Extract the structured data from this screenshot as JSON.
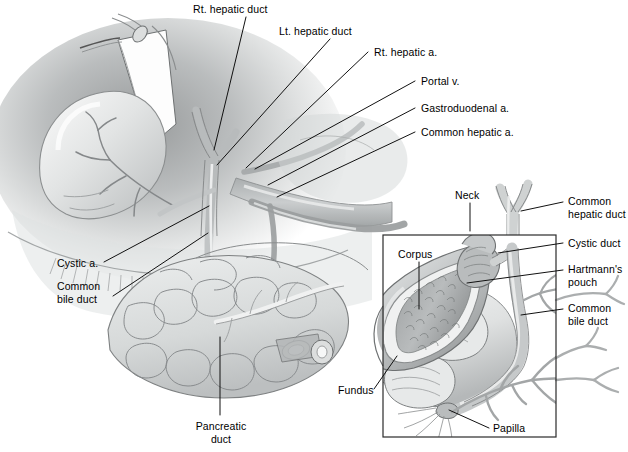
{
  "figure": {
    "style": "grayscale medical line-and-wash illustration",
    "width": 628,
    "height": 452
  },
  "colors": {
    "background": "#ffffff",
    "ink": "#000000",
    "leader_line": "#1a1a1a",
    "inset_border": "#2b2b2b",
    "tissue_light": "#e9eaea",
    "tissue_mid": "#c9cbcb",
    "tissue_dark": "#9a9c9d",
    "tissue_darkest": "#6f7273",
    "duct_fill": "#d7d9d9",
    "outline": "#6e7172"
  },
  "main_view": {
    "name": "operative-view",
    "labels": [
      {
        "id": "rt-hepatic-duct",
        "text": "Rt. hepatic duct",
        "x": 193,
        "y": 3,
        "align": "left",
        "leader": [
          [
            246,
            17
          ],
          [
            214,
            150
          ]
        ]
      },
      {
        "id": "lt-hepatic-duct",
        "text": "Lt. hepatic duct",
        "x": 279,
        "y": 25,
        "align": "left",
        "leader": [
          [
            330,
            39
          ],
          [
            216,
            164
          ]
        ]
      },
      {
        "id": "rt-hepatic-a",
        "text": "Rt. hepatic a.",
        "x": 371,
        "y": 47,
        "align": "left",
        "leader": [
          [
            368,
            52
          ],
          [
            245,
            167
          ]
        ]
      },
      {
        "id": "portal-v",
        "text": "Portal v.",
        "x": 418,
        "y": 76,
        "align": "left",
        "leader": [
          [
            415,
            81
          ],
          [
            254,
            168
          ]
        ]
      },
      {
        "id": "gastroduodenal-a",
        "text": "Gastroduodenal a.",
        "x": 418,
        "y": 103,
        "align": "left",
        "leader": [
          [
            415,
            108
          ],
          [
            268,
            184
          ]
        ]
      },
      {
        "id": "common-hepatic-a",
        "text": "Common hepatic a.",
        "x": 418,
        "y": 127,
        "align": "left",
        "leader": [
          [
            415,
            132
          ],
          [
            276,
            196
          ]
        ]
      },
      {
        "id": "cystic-a",
        "text": "Cystic a.",
        "x": 57,
        "y": 260,
        "align": "left",
        "leader": [
          [
            104,
            262
          ],
          [
            208,
            206
          ]
        ]
      },
      {
        "id": "common-bile-duct-main",
        "text": "Common\nbile duct",
        "x": 57,
        "y": 282,
        "align": "left",
        "leader": [
          [
            112,
            296
          ],
          [
            207,
            232
          ]
        ]
      },
      {
        "id": "pancreatic-duct",
        "text": "Pancreatic\nduct",
        "x": 191,
        "y": 422,
        "align": "center",
        "leader": [
          [
            220,
            415
          ],
          [
            220,
            338
          ]
        ]
      }
    ]
  },
  "inset_view": {
    "name": "detail-inset",
    "box": {
      "x": 383,
      "y": 235,
      "width": 173,
      "height": 202
    },
    "labels": [
      {
        "id": "neck",
        "text": "Neck",
        "x": 455,
        "y": 190,
        "align": "left",
        "leader": [
          [
            470,
            203
          ],
          [
            470,
            230
          ]
        ]
      },
      {
        "id": "corpus",
        "text": "Corpus",
        "x": 398,
        "y": 249,
        "align": "left",
        "leader": [
          [
            419,
            262
          ],
          [
            419,
            307
          ]
        ]
      },
      {
        "id": "common-hepatic-duct",
        "text": "Common\nhepatic duct",
        "x": 567,
        "y": 195,
        "align": "left",
        "leader": [
          [
            563,
            202
          ],
          [
            521,
            211
          ]
        ]
      },
      {
        "id": "cystic-duct",
        "text": "Cystic duct",
        "x": 567,
        "y": 238,
        "align": "left",
        "leader": [
          [
            563,
            243
          ],
          [
            499,
            253
          ]
        ]
      },
      {
        "id": "hartmanns-pouch",
        "text": "Hartmann's\npouch",
        "x": 567,
        "y": 264,
        "align": "left",
        "leader": [
          [
            563,
            270
          ],
          [
            468,
            283
          ]
        ]
      },
      {
        "id": "common-bile-duct-inset",
        "text": "Common\nbile duct",
        "x": 567,
        "y": 303,
        "align": "left",
        "leader": [
          [
            563,
            309
          ],
          [
            521,
            315
          ]
        ]
      },
      {
        "id": "fundus",
        "text": "Fundus",
        "x": 340,
        "y": 389,
        "align": "left",
        "leader": [
          [
            374,
            389
          ],
          [
            397,
            357
          ]
        ]
      },
      {
        "id": "papilla",
        "text": "Papilla",
        "x": 492,
        "y": 424,
        "align": "left",
        "leader": [
          [
            489,
            428
          ],
          [
            450,
            410
          ]
        ]
      }
    ]
  },
  "structures": [
    "liver",
    "gallbladder",
    "cystic artery",
    "right hepatic duct",
    "left hepatic duct",
    "common hepatic duct",
    "cystic duct",
    "common bile duct",
    "portal vein",
    "right hepatic artery",
    "common hepatic artery",
    "gastroduodenal artery",
    "pancreas",
    "pancreatic duct",
    "duodenum",
    "Hartmann's pouch",
    "papilla of Vater"
  ]
}
